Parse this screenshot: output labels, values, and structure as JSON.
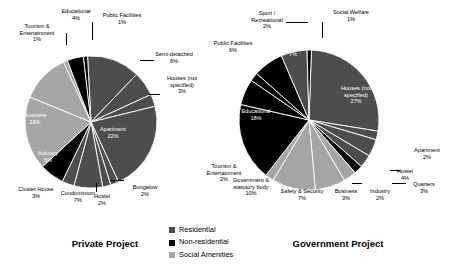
{
  "legend": {
    "items": [
      {
        "label": "Residential",
        "color": "#4d4d4d"
      },
      {
        "label": "Non-residential",
        "color": "#000000"
      },
      {
        "label": "Social Amenities",
        "color": "#a6a6a6"
      }
    ]
  },
  "chart_data": [
    {
      "type": "pie",
      "title": "Private Project",
      "legend_position": "bottom-center",
      "categories": [
        "Terrace",
        "Semi-detached",
        "Houses (not specified)",
        "Apartment",
        "Bungalow",
        "Hostel",
        "Condominium",
        "Cluster House",
        "Industry",
        "Business",
        "Office",
        "Tourism & Entertainment",
        "Educational",
        "Public Facilities"
      ],
      "values": [
        13,
        6,
        3,
        22,
        2,
        2,
        7,
        3,
        6,
        18,
        12,
        1,
        4,
        1
      ],
      "groups": [
        "Residential",
        "Residential",
        "Residential",
        "Residential",
        "Residential",
        "Residential",
        "Residential",
        "Residential",
        "Non-residential",
        "Social Amenities",
        "Social Amenities",
        "Social Amenities",
        "Non-residential",
        "Non-residential"
      ],
      "labels": [
        {
          "name": "Terrace",
          "value": "13%",
          "text": "Terrace\n13%"
        },
        {
          "name": "Semi-detached",
          "value": "6%",
          "text": "Semi-detached\n6%"
        },
        {
          "name": "Houses (not specified)",
          "value": "3%",
          "text": "Houses (not\nspecified)\n3%"
        },
        {
          "name": "Apartment",
          "value": "22%",
          "text": "Apartment\n22%"
        },
        {
          "name": "Bungalow",
          "value": "2%",
          "text": "Bungalow\n2%"
        },
        {
          "name": "Hostel",
          "value": "2%",
          "text": "Hostel\n2%"
        },
        {
          "name": "Condominium",
          "value": "7%",
          "text": "Condominium\n7%"
        },
        {
          "name": "Cluster House",
          "value": "3%",
          "text": "Cluster House\n3%"
        },
        {
          "name": "Industry",
          "value": "6%",
          "text": "Industry\n6%"
        },
        {
          "name": "Business",
          "value": "18%",
          "text": "Business\n18%"
        },
        {
          "name": "Office",
          "value": "12%",
          "text": "Office\n12%"
        },
        {
          "name": "Tourism & Entertainment",
          "value": "1%",
          "text": "Tourism &\nEntertainment\n1%"
        },
        {
          "name": "Educational",
          "value": "4%",
          "text": "Educational\n4%"
        },
        {
          "name": "Public Facilities",
          "value": "1%",
          "text": "Public Facilities\n1%"
        }
      ]
    },
    {
      "type": "pie",
      "title": "Government Project",
      "legend_position": "bottom-center",
      "categories": [
        "Houses (not specified)",
        "Apartment",
        "Hostel",
        "Quarters",
        "Industry",
        "Business",
        "Safety & Security",
        "Government & statutory body",
        "Tourism & Entertainment",
        "Educational",
        "Public Facilities",
        "Sport / Recreational",
        "Health",
        "Terrace",
        "Social Welfare"
      ],
      "values": [
        27,
        2,
        4,
        3,
        2,
        3,
        7,
        10,
        2,
        18,
        6,
        2,
        7,
        6,
        1
      ],
      "groups": [
        "Residential",
        "Residential",
        "Residential",
        "Residential",
        "Non-residential",
        "Social Amenities",
        "Social Amenities",
        "Social Amenities",
        "Social Amenities",
        "Non-residential",
        "Non-residential",
        "Non-residential",
        "Non-residential",
        "Residential",
        "Non-residential"
      ],
      "labels": [
        {
          "name": "Houses (not specified)",
          "value": "27%",
          "text": "Houses (not\nspecified)\n27%"
        },
        {
          "name": "Apartment",
          "value": "2%",
          "text": "Apartment\n2%"
        },
        {
          "name": "Hostel",
          "value": "4%",
          "text": "Hostel\n4%"
        },
        {
          "name": "Quarters",
          "value": "3%",
          "text": "Quarters\n3%"
        },
        {
          "name": "Industry",
          "value": "2%",
          "text": "Industry\n2%"
        },
        {
          "name": "Business",
          "value": "3%",
          "text": "Business\n3%"
        },
        {
          "name": "Safety & Security",
          "value": "7%",
          "text": "Safety & Security\n7%"
        },
        {
          "name": "Government & statutory body",
          "value": "10%",
          "text": "Government &\nstatutory body\n10%"
        },
        {
          "name": "Tourism & Entertainment",
          "value": "2%",
          "text": "Tourism &\nEntertainment\n2%"
        },
        {
          "name": "Educational",
          "value": "18%",
          "text": "Educational\n18%"
        },
        {
          "name": "Public Facilities",
          "value": "6%",
          "text": "Public Facilities\n6%"
        },
        {
          "name": "Sport / Recreational",
          "value": "2%",
          "text": "Sport /\nRecreational\n2%"
        },
        {
          "name": "Health",
          "value": "7%",
          "text": "Health\n7%"
        },
        {
          "name": "Terrace",
          "value": "6%",
          "text": "Terrace\n6%"
        },
        {
          "name": "Social Welfare",
          "value": "1%",
          "text": "Social Welfare\n1%"
        }
      ]
    }
  ],
  "colors": {
    "residential": "#4d4d4d",
    "non_residential": "#000000",
    "social_amenities": "#a6a6a6",
    "separator": "#ffffff",
    "text": "#000000",
    "text_inverse": "#ffffff"
  },
  "geometry": {
    "private": {
      "cx": 91,
      "cy": 122,
      "r": 66,
      "start_angle": -93
    },
    "government": {
      "cx": 309,
      "cy": 120,
      "r": 70,
      "start_angle": -88
    }
  },
  "label_layout": {
    "private": [
      {
        "name": "Terrace",
        "x": 93,
        "y": 41,
        "w": 52,
        "inside": true
      },
      {
        "name": "Semi-detached",
        "x": 146,
        "y": 51,
        "w": 56,
        "inside": false
      },
      {
        "name": "Houses (not specified)",
        "x": 158,
        "y": 75,
        "w": 48,
        "inside": false
      },
      {
        "name": "Apartment",
        "x": 88,
        "y": 126,
        "w": 50,
        "inside": true
      },
      {
        "name": "Bungalow",
        "x": 124,
        "y": 184,
        "w": 42,
        "inside": false
      },
      {
        "name": "Hostel",
        "x": 87,
        "y": 193,
        "w": 30,
        "inside": false
      },
      {
        "name": "Condominium",
        "x": 53,
        "y": 190,
        "w": 50,
        "inside": false
      },
      {
        "name": "Cluster House",
        "x": 10,
        "y": 186,
        "w": 52,
        "inside": false
      },
      {
        "name": "Industry",
        "x": 29,
        "y": 150,
        "w": 38,
        "inside": true
      },
      {
        "name": "Business",
        "x": 14,
        "y": 112,
        "w": 42,
        "inside": true
      },
      {
        "name": "Office",
        "x": 22,
        "y": 62,
        "w": 38,
        "inside": true
      },
      {
        "name": "Tourism & Entertainment",
        "x": 8,
        "y": 23,
        "w": 58,
        "inside": false
      },
      {
        "name": "Educational",
        "x": 51,
        "y": 8,
        "w": 50,
        "inside": false
      },
      {
        "name": "Public Facilities",
        "x": 93,
        "y": 12,
        "w": 58,
        "inside": false
      }
    ],
    "government": [
      {
        "name": "Houses (not specified)",
        "x": 330,
        "y": 85,
        "w": 52,
        "inside": true
      },
      {
        "name": "Apartment",
        "x": 404,
        "y": 147,
        "w": 46,
        "inside": false
      },
      {
        "name": "Hostel",
        "x": 390,
        "y": 168,
        "w": 30,
        "inside": false
      },
      {
        "name": "Quarters",
        "x": 404,
        "y": 181,
        "w": 40,
        "inside": false
      },
      {
        "name": "Industry",
        "x": 363,
        "y": 188,
        "w": 34,
        "inside": false
      },
      {
        "name": "Business",
        "x": 328,
        "y": 188,
        "w": 36,
        "inside": false
      },
      {
        "name": "Safety & Security",
        "x": 275,
        "y": 188,
        "w": 54,
        "inside": false
      },
      {
        "name": "Government & statutory body",
        "x": 224,
        "y": 177,
        "w": 54,
        "inside": false
      },
      {
        "name": "Tourism & Entertainment",
        "x": 196,
        "y": 163,
        "w": 56,
        "inside": false
      },
      {
        "name": "Educational",
        "x": 230,
        "y": 108,
        "w": 52,
        "inside": true
      },
      {
        "name": "Public Facilities",
        "x": 206,
        "y": 40,
        "w": 54,
        "inside": false
      },
      {
        "name": "Sport / Recreational",
        "x": 240,
        "y": 10,
        "w": 54,
        "inside": false
      },
      {
        "name": "Health",
        "x": 276,
        "y": 44,
        "w": 34,
        "inside": true
      },
      {
        "name": "Terrace",
        "x": 311,
        "y": 40,
        "w": 32,
        "inside": true
      },
      {
        "name": "Social Welfare",
        "x": 323,
        "y": 9,
        "w": 56,
        "inside": false
      }
    ]
  }
}
